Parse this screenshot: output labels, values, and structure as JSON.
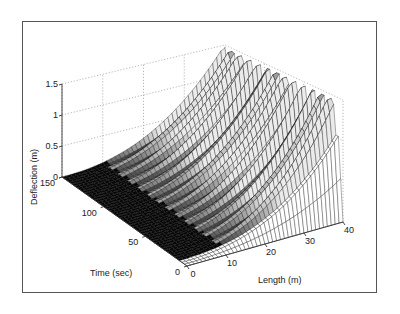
{
  "chart_data": {
    "type": "surface",
    "title": "",
    "xlabel": "Length (m)",
    "ylabel": "Time (sec)",
    "zlabel": "Deflection (m)",
    "x_ticks": [
      0,
      10,
      20,
      30,
      40
    ],
    "y_ticks": [
      0,
      50,
      100,
      150
    ],
    "z_ticks": [
      0,
      0.5,
      1,
      1.5
    ],
    "xlim": [
      0,
      40
    ],
    "ylim": [
      0,
      150
    ],
    "zlim": [
      0,
      1.5
    ],
    "grid": true,
    "surface_samples": {
      "length": [
        0,
        10,
        20,
        30,
        40
      ],
      "deflection_at_length": [
        0.0,
        0.08,
        0.3,
        0.7,
        1.3
      ]
    }
  },
  "axes": {
    "z_tick_labels": [
      "0",
      "0.5",
      "1",
      "1.5"
    ],
    "time_tick_labels": [
      "0",
      "50",
      "100",
      "150"
    ],
    "length_tick_labels": [
      "0",
      "10",
      "20",
      "30",
      "40"
    ],
    "zlabel": "Deflection (m)",
    "time_label": "Time (sec)",
    "length_label": "Length (m)"
  }
}
